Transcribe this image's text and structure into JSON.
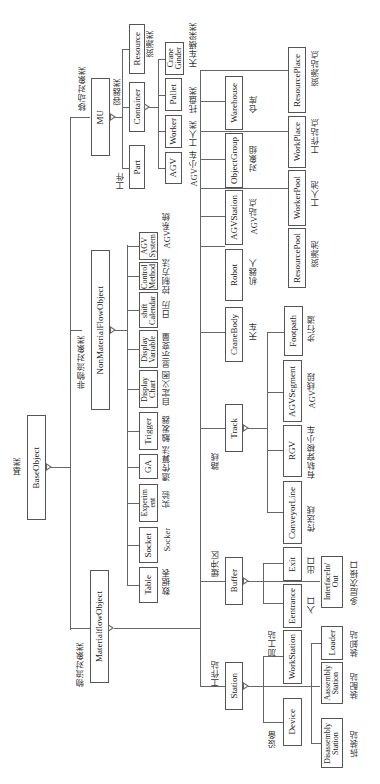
{
  "root": {
    "name": "BaseObject",
    "label_cn": "基类"
  },
  "material_flow": {
    "name": "MaterialflowObject",
    "label_cn": "物流对象类"
  },
  "non_material_flow": {
    "name": "NonMaterialFlowObject",
    "label_cn": "非物流对象类"
  },
  "mu": {
    "name": "MU",
    "label_cn": "移动对象类"
  },
  "mu_children": [
    {
      "name": "Part",
      "label_cn": "工件"
    },
    {
      "name": "Container",
      "label_cn": "容器类"
    },
    {
      "name": "Resource",
      "label_cn": "资源类"
    }
  ],
  "container_children": [
    {
      "name": "AGV",
      "label_cn": "AGV小车"
    },
    {
      "name": "Worker",
      "label_cn": "工人类"
    },
    {
      "name": "Pallet",
      "label_cn": "托盘类"
    },
    {
      "name": "Crane\nGinder",
      "label_cn": "天车横梁类"
    }
  ],
  "nmf_children": [
    {
      "name": "Table",
      "label_cn": "数据表"
    },
    {
      "name": "Socket",
      "label_cn": "Socker"
    },
    {
      "name": "Experim\nent",
      "label_cn": "实验"
    },
    {
      "name": "GA",
      "label_cn": "遗传算法"
    },
    {
      "name": "Trigger",
      "label_cn": "触发器"
    },
    {
      "name": "Display\nChart",
      "label_cn": "自定义图"
    },
    {
      "name": "Display\nVariable",
      "label_cn": "显示变量"
    },
    {
      "name": "shift\nCalendar",
      "label_cn": "日历"
    },
    {
      "name": "Control\nMethod",
      "label_cn": "控制方法"
    },
    {
      "name": "AGV\nSystem",
      "label_cn": "AGV系统"
    }
  ],
  "mf_children": [
    {
      "name": "Station",
      "label_cn": "工作站"
    },
    {
      "name": "Buffer",
      "label_cn": "缓冲区"
    },
    {
      "name": "Track",
      "label_cn": "路线"
    },
    {
      "name": "CraneBody",
      "label_cn": "天车"
    },
    {
      "name": "Robot",
      "label_cn": "机器人"
    },
    {
      "name": "AGVStation",
      "label_cn": "AGV站点"
    },
    {
      "name": "ObjectGroup",
      "label_cn": "对象组"
    },
    {
      "name": "Warehouse",
      "label_cn": "仓库"
    }
  ],
  "station_children": [
    {
      "name": "Device",
      "label_cn": "设备"
    },
    {
      "name": "WorkStation",
      "label_cn": "加工站"
    }
  ],
  "workstation_children": [
    {
      "name": "Disassembly\nStation",
      "label_cn": "拆装站"
    },
    {
      "name": "Aassembly\nStation",
      "label_cn": "装配站"
    },
    {
      "name": "Loader",
      "label_cn": "装卸站"
    }
  ],
  "buffer_children": [
    {
      "name": "Eentrance",
      "label_cn": "入口"
    },
    {
      "name": "Exit",
      "label_cn": "出口"
    },
    {
      "name": "InterfaceIn/\nOut",
      "label_cn": "多层次接口"
    }
  ],
  "track_children": [
    {
      "name": "ConveyorLine",
      "label_cn": "传送线"
    },
    {
      "name": "RGV",
      "label_cn": "有轨穿梭小车"
    },
    {
      "name": "AGVSegment",
      "label_cn": "AGV线段"
    },
    {
      "name": "Footpath",
      "label_cn": "步行道"
    }
  ],
  "pool_children": [
    {
      "name": "ResourcePool",
      "label_cn": "资源池"
    },
    {
      "name": "WorkerPool",
      "label_cn": "工人池"
    },
    {
      "name": "WorkPlace",
      "label_cn": "工作站点"
    },
    {
      "name": "ResourcePlace",
      "label_cn": "资源站点"
    }
  ]
}
